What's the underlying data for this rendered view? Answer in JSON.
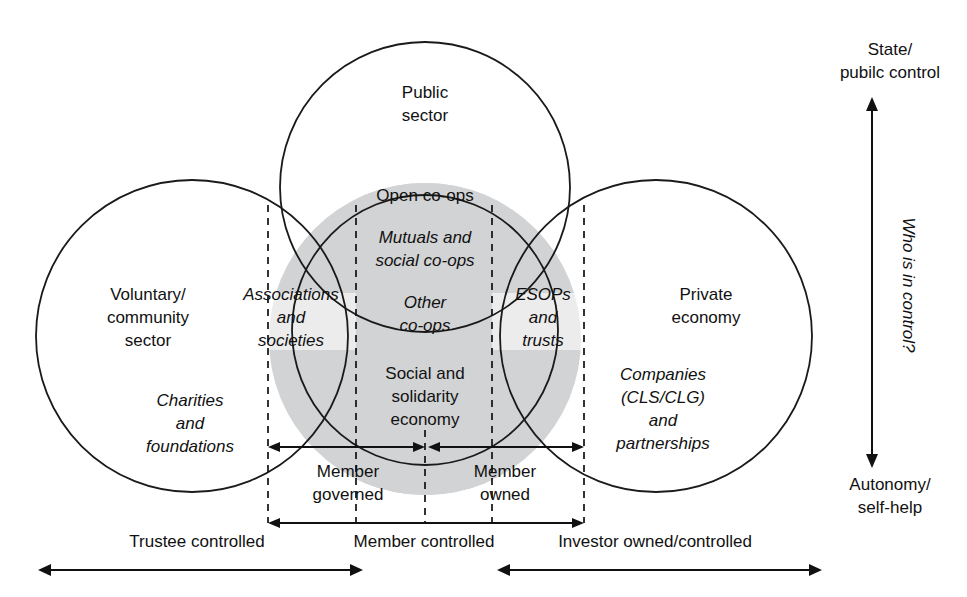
{
  "diagram": {
    "title_present": false,
    "circles": {
      "public_sector": {
        "label_line1": "Public",
        "label_line2": "sector"
      },
      "voluntary": {
        "label_line1": "Voluntary/",
        "label_line2": "community",
        "label_line3": "sector",
        "italic_line1": "Charities",
        "italic_line2": "and",
        "italic_line3": "foundations"
      },
      "private": {
        "label_line1": "Private",
        "label_line2": "economy",
        "italic_line1": "Companies",
        "italic_line2": "(CLS/CLG)",
        "italic_line3": "and",
        "italic_line4": "partnerships"
      }
    },
    "overlap_labels": {
      "open_coops": "Open co-ops",
      "mutuals_line1": "Mutuals and",
      "mutuals_line2": "social co-ops",
      "associations_line1": "Associations",
      "associations_line2": "and",
      "associations_line3": "societies",
      "other_coops_line1": "Other",
      "other_coops_line2": "co-ops",
      "esops_line1": "ESOPs",
      "esops_line2": "and",
      "esops_line3": "trusts",
      "sse_line1": "Social and",
      "sse_line2": "solidarity",
      "sse_line3": "economy"
    },
    "inner_axis_labels": {
      "member_governed_line1": "Member",
      "member_governed_line2": "governed",
      "member_owned_line1": "Member",
      "member_owned_line2": "owned"
    },
    "bottom_labels": {
      "trustee": "Trustee controlled",
      "member": "Member controlled",
      "investor": "Investor owned/controlled"
    },
    "vertical_axis": {
      "top_line1": "State/",
      "top_line2": "pubilc control",
      "rotated_label": "Who is in control?",
      "bottom_line1": "Autonomy/",
      "bottom_line2": "self-help"
    },
    "colors": {
      "stroke": "#1a1a1a",
      "light_grey": "#ececed",
      "mid_grey": "#d2d3d4",
      "background": "#ffffff"
    }
  }
}
